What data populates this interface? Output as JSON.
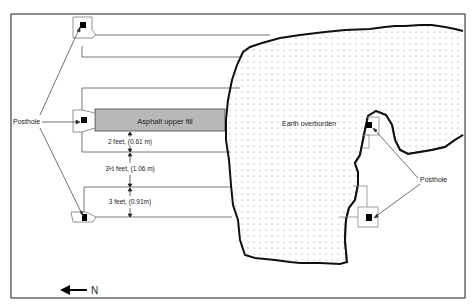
{
  "diagram": {
    "type": "archaeological site plan",
    "labels": {
      "posthole_left": "Posthole",
      "posthole_right": "Posthole",
      "asphalt": "Asphalt upper fill",
      "earth": "Earth overburden",
      "dim_1": "2 feet, (0.61 m)",
      "dim_2": "3½ feet, (1.06 m)",
      "dim_3": "3 feet, (0.91m)",
      "north": "N"
    },
    "colors": {
      "asphalt_fill": "#b8b8b8",
      "outline": "#111111",
      "frame": "#333333",
      "box_stroke": "#888888"
    }
  }
}
